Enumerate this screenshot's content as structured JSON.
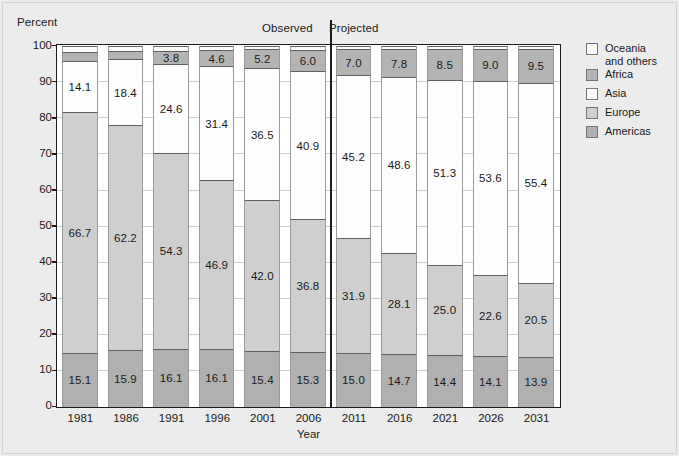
{
  "figure": {
    "background_color": "#ececec",
    "plot_background_color": "#ffffff",
    "axis_color": "#1c1c1c"
  },
  "header": {
    "y_axis_caption": "Percent",
    "observed_label": "Observed",
    "projected_label": "Projected"
  },
  "legend": {
    "entries": [
      {
        "label": "Oceania\nand others",
        "color": "#fbfbfb"
      },
      {
        "label": "Africa",
        "color": "#b4b4b4"
      },
      {
        "label": "Asia",
        "color": "#fdfdfd"
      },
      {
        "label": "Europe",
        "color": "#cfcfcf"
      },
      {
        "label": "Americas",
        "color": "#b0b0b0"
      }
    ]
  },
  "chart_data": {
    "type": "bar",
    "stacked": true,
    "title": "",
    "subtitle": "",
    "xlabel": "Year",
    "ylabel": "Percent",
    "ylim": [
      0,
      100
    ],
    "yticks": [
      0,
      10,
      20,
      30,
      40,
      50,
      60,
      70,
      80,
      90,
      100
    ],
    "ytick_labels": [
      "0",
      "10",
      "20",
      "30",
      "40",
      "50",
      "60",
      "70",
      "80",
      "90",
      "100"
    ],
    "grid": true,
    "legend_position": "right",
    "categories": [
      "1981",
      "1986",
      "1991",
      "1996",
      "2001",
      "2006",
      "2011",
      "2016",
      "2021",
      "2026",
      "2031"
    ],
    "observed_categories": [
      "1981",
      "1986",
      "1991",
      "1996",
      "2001",
      "2006"
    ],
    "projected_categories": [
      "2011",
      "2016",
      "2021",
      "2026",
      "2031"
    ],
    "divider_after_category": "2006",
    "annotations": [
      "Observed",
      "Projected"
    ],
    "series": [
      {
        "name": "Americas",
        "color": "#b0b0b0",
        "values": [
          15.1,
          15.9,
          16.1,
          16.1,
          15.4,
          15.3,
          15.0,
          14.7,
          14.4,
          14.1,
          13.9
        ],
        "labels": [
          "15.1",
          "15.9",
          "16.1",
          "16.1",
          "15.4",
          "15.3",
          "15.0",
          "14.7",
          "14.4",
          "14.1",
          "13.9"
        ]
      },
      {
        "name": "Europe",
        "color": "#cfcfcf",
        "values": [
          66.7,
          62.2,
          54.3,
          46.9,
          42.0,
          36.8,
          31.9,
          28.1,
          25.0,
          22.6,
          20.5
        ],
        "labels": [
          "66.7",
          "62.2",
          "54.3",
          "46.9",
          "42.0",
          "36.8",
          "31.9",
          "28.1",
          "25.0",
          "22.6",
          "20.5"
        ]
      },
      {
        "name": "Asia",
        "color": "#fdfdfd",
        "values": [
          14.1,
          18.4,
          24.6,
          31.4,
          36.5,
          40.9,
          45.2,
          48.6,
          51.3,
          53.6,
          55.4
        ],
        "labels": [
          "14.1",
          "18.4",
          "24.6",
          "31.4",
          "36.5",
          "40.9",
          "45.2",
          "48.6",
          "51.3",
          "53.6",
          "55.4"
        ]
      },
      {
        "name": "Africa",
        "color": "#b4b4b4",
        "values": [
          2.6,
          2.3,
          3.8,
          4.6,
          5.2,
          6.0,
          7.0,
          7.8,
          8.5,
          9.0,
          9.5
        ],
        "labels": [
          "",
          "",
          "3.8",
          "4.6",
          "5.2",
          "6.0",
          "7.0",
          "7.8",
          "8.5",
          "9.0",
          "9.5"
        ]
      },
      {
        "name": "Oceania and others",
        "color": "#fbfbfb",
        "values": [
          1.5,
          1.2,
          1.2,
          1.0,
          0.9,
          1.0,
          0.9,
          0.8,
          0.8,
          0.7,
          0.7
        ],
        "labels": [
          "",
          "",
          "",
          "",
          "",
          "",
          "",
          "",
          "",
          "",
          ""
        ]
      }
    ]
  }
}
